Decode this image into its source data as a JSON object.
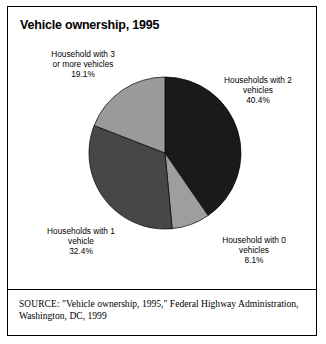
{
  "figure": {
    "title": "Vehicle ownership, 1995",
    "source_prefix": "SOURCE:",
    "source_body": " \"Vehicle ownership, 1995,\" Federal Highway Administration, Washington, DC, 1999"
  },
  "labels": {
    "three_plus": "Household with 3\nor more vehicles\n19.1%",
    "two": "Households with 2\nvehicles\n40.4%",
    "one": "Households with 1\nvehicle\n32.4%",
    "zero": "Household with 0\nvehicles\n8.1%"
  },
  "chart_data": {
    "type": "pie",
    "title": "Vehicle ownership, 1995",
    "xlabel": "",
    "ylabel": "",
    "legend_position": "none",
    "grid": false,
    "units": "percent",
    "start_angle_deg": 0,
    "direction": "clockwise",
    "center": {
      "x": 157,
      "y": 146
    },
    "radius": 76,
    "categories": [
      "Households with 2 vehicles",
      "Household with 0 vehicles",
      "Households with 1 vehicle",
      "Household with 3 or more vehicles"
    ],
    "values": [
      40.4,
      8.1,
      32.4,
      19.1
    ],
    "value_labels": [
      "40.4%",
      "8.1%",
      "32.4%",
      "19.1%"
    ],
    "colors": [
      "#1a1a1a",
      "#9e9e9e",
      "#474747",
      "#9a9a9a"
    ],
    "slices": [
      {
        "label": "Households with 2 vehicles",
        "value": 40.4,
        "value_label": "40.4%",
        "color": "#1a1a1a",
        "start_deg": 0,
        "end_deg": 145.44
      },
      {
        "label": "Household with 0 vehicles",
        "value": 8.1,
        "value_label": "8.1%",
        "color": "#9e9e9e",
        "start_deg": 145.44,
        "end_deg": 174.6
      },
      {
        "label": "Households with 1 vehicle",
        "value": 32.4,
        "value_label": "32.4%",
        "color": "#474747",
        "start_deg": 174.6,
        "end_deg": 291.24
      },
      {
        "label": "Household with 3 or more vehicles",
        "value": 19.1,
        "value_label": "19.1%",
        "color": "#9a9a9a",
        "start_deg": 291.24,
        "end_deg": 360
      }
    ],
    "total": 100.0,
    "annotations": [
      "Household with 3 or more vehicles 19.1%",
      "Households with 2 vehicles 40.4%",
      "Households with 1 vehicle 32.4%",
      "Household with 0 vehicles 8.1%"
    ]
  }
}
